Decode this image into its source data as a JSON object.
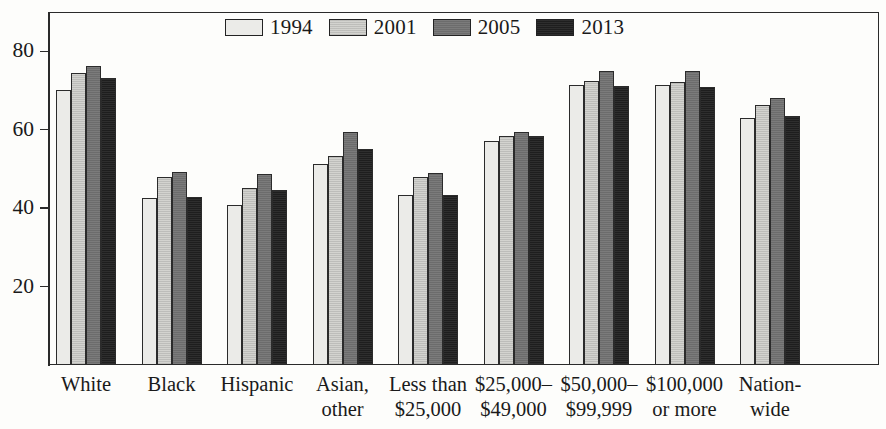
{
  "chart_data": {
    "type": "bar",
    "title": "",
    "subtitle": "",
    "xlabel": "",
    "ylabel": "",
    "ylim": [
      0,
      90
    ],
    "ytick_values": [
      20,
      40,
      60,
      80
    ],
    "ytick_labels": [
      "20",
      "40",
      "60",
      "80"
    ],
    "grid": false,
    "legend_position": "top-center",
    "categories": [
      [
        "White"
      ],
      [
        "Black"
      ],
      [
        "Hispanic"
      ],
      [
        "Asian,",
        "other"
      ],
      [
        "Less than",
        "$25,000"
      ],
      [
        "$25,000–",
        "$49,000"
      ],
      [
        "$50,000–",
        "$99,999"
      ],
      [
        "$100,000",
        "or more"
      ],
      [
        "Nation-",
        "wide"
      ]
    ],
    "series": [
      {
        "name": "1994",
        "color": "#ebebe8",
        "values": [
          70.0,
          42.5,
          40.8,
          51.2,
          43.3,
          57.2,
          71.5,
          71.4,
          63.0
        ]
      },
      {
        "name": "2001",
        "color": "#d3d3cf",
        "values": [
          74.5,
          48.0,
          45.2,
          53.3,
          48.0,
          58.5,
          72.3,
          72.1,
          66.4
        ]
      },
      {
        "name": "2005",
        "color": "#6c6c6c",
        "values": [
          76.2,
          49.2,
          48.8,
          59.5,
          48.9,
          59.5,
          75.0,
          74.9,
          68.0
        ]
      },
      {
        "name": "2013",
        "color": "#1e1e1e",
        "values": [
          73.2,
          42.8,
          44.7,
          55.2,
          43.4,
          58.4,
          71.1,
          70.9,
          63.4
        ]
      }
    ]
  },
  "legend": {
    "items": [
      {
        "label": "1994",
        "swatch": "#ebebe8"
      },
      {
        "label": "2001",
        "swatch": "#d3d3cf"
      },
      {
        "label": "2005",
        "swatch": "#6c6c6c"
      },
      {
        "label": "2013",
        "swatch": "#1e1e1e"
      }
    ]
  },
  "y_axis": {
    "ticks": [
      "80",
      "60",
      "40",
      "20"
    ]
  }
}
